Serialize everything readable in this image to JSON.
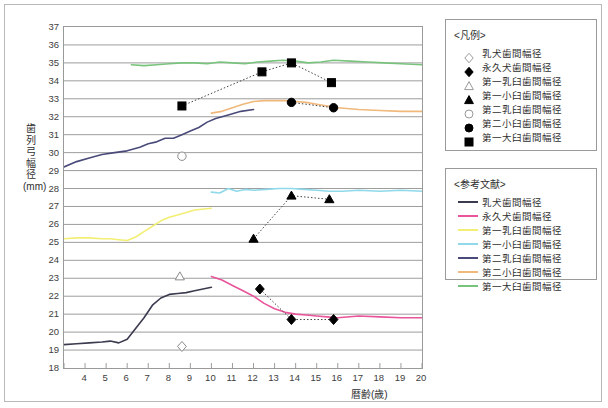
{
  "chart_data": {
    "type": "line",
    "title": "",
    "xlabel": "暦齢(歳)",
    "ylabel": "歯列弓幅径(mm)",
    "xlim": [
      3,
      20
    ],
    "ylim": [
      18,
      37
    ],
    "xticks": [
      3,
      4,
      5,
      6,
      7,
      8,
      9,
      10,
      11,
      12,
      13,
      14,
      15,
      16,
      17,
      18,
      19,
      20
    ],
    "yticks": [
      18,
      19,
      20,
      21,
      22,
      23,
      24,
      25,
      26,
      27,
      28,
      29,
      30,
      31,
      32,
      33,
      34,
      35,
      36,
      37
    ],
    "grid": true,
    "legend_position": "right",
    "marker_series": [
      {
        "name": "乳犬歯間幅径",
        "marker": "open-diamond",
        "color": "#555555",
        "points": [
          [
            8.6,
            19.2
          ]
        ]
      },
      {
        "name": "永久犬歯間幅径",
        "marker": "filled-diamond",
        "color": "#000000",
        "points": [
          [
            12.3,
            22.4
          ],
          [
            13.8,
            20.7
          ],
          [
            15.8,
            20.7
          ]
        ]
      },
      {
        "name": "第一乳臼歯間幅径",
        "marker": "open-triangle",
        "color": "#555555",
        "points": [
          [
            8.5,
            23.1
          ]
        ]
      },
      {
        "name": "第一小臼歯間幅径",
        "marker": "filled-triangle",
        "color": "#000000",
        "points": [
          [
            12.0,
            25.2
          ],
          [
            13.8,
            27.6
          ],
          [
            15.6,
            27.4
          ]
        ]
      },
      {
        "name": "第二乳臼歯間幅径",
        "marker": "open-circle",
        "color": "#555555",
        "points": [
          [
            8.6,
            29.8
          ]
        ]
      },
      {
        "name": "第二小臼歯間幅径",
        "marker": "filled-circle",
        "color": "#000000",
        "points": [
          [
            13.8,
            32.8
          ],
          [
            15.8,
            32.5
          ]
        ]
      },
      {
        "name": "第一大臼歯間幅径",
        "marker": "filled-square",
        "color": "#000000",
        "points": [
          [
            8.6,
            32.6
          ],
          [
            12.4,
            34.5
          ],
          [
            13.8,
            35.0
          ],
          [
            15.7,
            33.9
          ]
        ]
      }
    ],
    "reference_series": [
      {
        "name": "乳犬歯間幅径",
        "color": "#3b3b4f",
        "x": [
          3.0,
          3.6,
          4.2,
          4.8,
          5.2,
          5.6,
          6.0,
          6.4,
          6.8,
          7.2,
          7.6,
          8.0,
          8.4,
          8.8,
          9.2,
          9.6,
          10.0
        ],
        "y": [
          19.3,
          19.35,
          19.4,
          19.45,
          19.5,
          19.4,
          19.6,
          20.2,
          20.8,
          21.5,
          21.9,
          22.1,
          22.15,
          22.2,
          22.3,
          22.4,
          22.5
        ]
      },
      {
        "name": "永久犬歯間幅径",
        "color": "#e8559a",
        "x": [
          10.0,
          10.5,
          11.0,
          11.5,
          12.0,
          12.5,
          13.0,
          13.5,
          14.0,
          14.5,
          15.0,
          15.5,
          16.0,
          17.0,
          18.0,
          19.0,
          20.0
        ],
        "y": [
          23.1,
          22.9,
          22.6,
          22.3,
          22.0,
          21.6,
          21.3,
          21.1,
          21.0,
          20.95,
          20.9,
          20.85,
          20.8,
          20.9,
          20.85,
          20.8,
          20.8
        ]
      },
      {
        "name": "第一乳臼歯間幅径",
        "color": "#f2ef74",
        "x": [
          3.0,
          3.6,
          4.2,
          4.8,
          5.2,
          5.6,
          6.0,
          6.4,
          6.8,
          7.2,
          7.6,
          8.0,
          8.6,
          9.2,
          10.0
        ],
        "y": [
          25.2,
          25.25,
          25.25,
          25.2,
          25.2,
          25.15,
          25.1,
          25.3,
          25.6,
          25.9,
          26.2,
          26.4,
          26.6,
          26.8,
          26.9
        ]
      },
      {
        "name": "第一小臼歯間幅径",
        "color": "#8fd9ea",
        "x": [
          10.0,
          10.4,
          10.8,
          11.2,
          11.6,
          12.0,
          12.6,
          13.2,
          13.8,
          14.4,
          15.0,
          15.6,
          16.2,
          17.0,
          18.0,
          19.0,
          20.0
        ],
        "y": [
          27.8,
          27.75,
          28.0,
          27.85,
          27.95,
          27.9,
          27.95,
          28.0,
          28.0,
          27.95,
          27.9,
          27.85,
          27.85,
          27.9,
          27.85,
          27.9,
          27.85
        ]
      },
      {
        "name": "第二乳臼歯間幅径",
        "color": "#4a4a7a",
        "x": [
          3.0,
          3.6,
          4.2,
          4.8,
          5.4,
          6.0,
          6.6,
          7.0,
          7.4,
          7.8,
          8.2,
          8.6,
          9.0,
          9.4,
          9.8,
          10.2,
          10.8,
          11.4,
          12.0
        ],
        "y": [
          29.2,
          29.5,
          29.7,
          29.9,
          30.0,
          30.1,
          30.3,
          30.5,
          30.6,
          30.8,
          30.8,
          31.0,
          31.2,
          31.4,
          31.7,
          31.9,
          32.1,
          32.3,
          32.4
        ]
      },
      {
        "name": "第二小臼歯間幅径",
        "color": "#f0b87a",
        "x": [
          10.0,
          10.5,
          11.0,
          11.5,
          12.0,
          12.5,
          13.0,
          13.5,
          14.0,
          14.5,
          15.0,
          15.5,
          16.0,
          17.0,
          18.0,
          19.0,
          20.0
        ],
        "y": [
          32.2,
          32.3,
          32.5,
          32.7,
          32.85,
          32.9,
          32.9,
          32.9,
          32.85,
          32.8,
          32.7,
          32.6,
          32.5,
          32.4,
          32.35,
          32.3,
          32.3
        ]
      },
      {
        "name": "第一大臼歯間幅径",
        "color": "#79c47d",
        "x": [
          6.2,
          6.8,
          7.4,
          8.0,
          8.6,
          9.2,
          9.8,
          10.4,
          11.0,
          11.6,
          12.2,
          12.8,
          13.4,
          14.0,
          14.6,
          15.2,
          15.8,
          16.6,
          17.4,
          18.2,
          19.0,
          20.0
        ],
        "y": [
          34.9,
          34.85,
          34.9,
          34.95,
          35.0,
          35.0,
          34.95,
          35.05,
          35.0,
          34.95,
          35.05,
          35.1,
          35.15,
          35.1,
          35.0,
          35.05,
          35.15,
          35.1,
          35.05,
          35.0,
          34.95,
          34.9
        ]
      }
    ]
  },
  "legend_symbols": {
    "title": "<凡例>",
    "items": [
      {
        "label": "乳犬歯間幅径",
        "marker": "open-diamond"
      },
      {
        "label": "永久犬歯間幅径",
        "marker": "filled-diamond"
      },
      {
        "label": "第一乳臼歯間幅径",
        "marker": "open-triangle"
      },
      {
        "label": "第一小臼歯間幅径",
        "marker": "filled-triangle"
      },
      {
        "label": "第二乳臼歯間幅径",
        "marker": "open-circle"
      },
      {
        "label": "第二小臼歯間幅径",
        "marker": "filled-circle"
      },
      {
        "label": "第一大臼歯間幅径",
        "marker": "filled-square"
      }
    ]
  },
  "legend_refs": {
    "title": "<参考文献>",
    "items": [
      {
        "label": "乳犬歯間幅径",
        "color": "#3b3b4f"
      },
      {
        "label": "永久犬歯間幅径",
        "color": "#e8559a"
      },
      {
        "label": "第一乳臼歯間幅径",
        "color": "#f2ef74"
      },
      {
        "label": "第一小臼歯間幅径",
        "color": "#8fd9ea"
      },
      {
        "label": "第二乳臼歯間幅径",
        "color": "#4a4a7a"
      },
      {
        "label": "第二小臼歯間幅径",
        "color": "#f0b87a"
      },
      {
        "label": "第一大臼歯間幅径",
        "color": "#79c47d"
      }
    ]
  }
}
